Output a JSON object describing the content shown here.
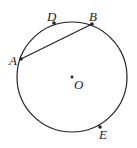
{
  "diagram": {
    "type": "circle-geometry",
    "circle": {
      "center": "O",
      "cx": 72,
      "cy": 77,
      "r": 55
    },
    "points": [
      {
        "name": "A",
        "x": 21,
        "y": 59,
        "label_x": 9,
        "label_y": 54
      },
      {
        "name": "B",
        "x": 92,
        "y": 24,
        "label_x": 89,
        "label_y": 10
      },
      {
        "name": "D",
        "x": 54,
        "y": 23,
        "label_x": 47,
        "label_y": 10
      },
      {
        "name": "E",
        "x": 100,
        "y": 127,
        "label_x": 99,
        "label_y": 128
      },
      {
        "name": "O",
        "x": 72,
        "y": 77,
        "label_x": 74,
        "label_y": 78
      }
    ],
    "segments": [
      {
        "from": "A",
        "to": "B"
      }
    ],
    "labels": {
      "A": "A",
      "B": "B",
      "D": "D",
      "E": "E",
      "O": "O"
    },
    "colors": {
      "stroke": "#222222",
      "background": "#ffffff"
    }
  }
}
